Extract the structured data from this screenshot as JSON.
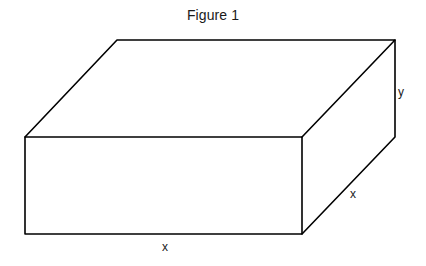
{
  "figure": {
    "title": "Figure 1",
    "shape": "rectangular-box",
    "background_color": "#ffffff",
    "line_color": "#000000",
    "text_color": "#1a1a1a",
    "labels": [
      {
        "id": "width",
        "text": "x",
        "position": "bottom-front-edge"
      },
      {
        "id": "depth",
        "text": "x",
        "position": "bottom-right-diagonal-edge"
      },
      {
        "id": "height",
        "text": "y",
        "position": "right-vertical-edge"
      }
    ],
    "geometry": {
      "description": "Oblique projection of a rectangular box (cuboid) with square base of side x and height y",
      "vertices": {
        "front_top_left": [
          25,
          137
        ],
        "front_top_right": [
          302,
          137
        ],
        "front_bottom_left": [
          25,
          234
        ],
        "front_bottom_right": [
          302,
          234
        ],
        "back_top_left": [
          117,
          40
        ],
        "back_top_right": [
          395,
          40
        ],
        "back_bottom_right": [
          395,
          137
        ]
      },
      "edges": [
        "front_top_left-front_top_right",
        "front_top_right-front_bottom_right",
        "front_bottom_right-front_bottom_left",
        "front_bottom_left-front_top_left",
        "front_top_left-back_top_left",
        "back_top_left-back_top_right",
        "back_top_right-front_top_right",
        "back_top_right-back_bottom_right",
        "back_bottom_right-front_bottom_right"
      ]
    }
  }
}
